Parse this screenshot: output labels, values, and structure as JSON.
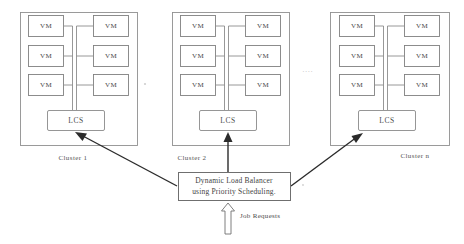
{
  "diagram": {
    "ink_color": "#4a4a4a",
    "frame_color": "#909090",
    "arrow_color": "#2b2b2b"
  },
  "clusters": [
    {
      "caption": "Cluster 1",
      "vms": [
        {
          "label": "VM"
        },
        {
          "label": "VM"
        },
        {
          "label": "VM"
        },
        {
          "label": "VM"
        },
        {
          "label": "VM"
        },
        {
          "label": "VM"
        }
      ],
      "controller": {
        "label": "LCS"
      }
    },
    {
      "caption": "Cluster 2",
      "vms": [
        {
          "label": "VM"
        },
        {
          "label": "VM"
        },
        {
          "label": "VM"
        },
        {
          "label": "VM"
        },
        {
          "label": "VM"
        },
        {
          "label": "VM"
        }
      ],
      "controller": {
        "label": "LCS"
      }
    },
    {
      "caption": "Cluster n",
      "vms": [
        {
          "label": "VM"
        },
        {
          "label": "VM"
        },
        {
          "label": "VM"
        },
        {
          "label": "VM"
        },
        {
          "label": "VM"
        },
        {
          "label": "VM"
        }
      ],
      "controller": {
        "label": "LCS"
      }
    }
  ],
  "ellipsis": {
    "between_clusters": "...."
  },
  "load_balancer": {
    "line1": "Dynamic Load Balancer",
    "line2": "using Priority Scheduling."
  },
  "job_requests": {
    "label": "Job Requests"
  }
}
